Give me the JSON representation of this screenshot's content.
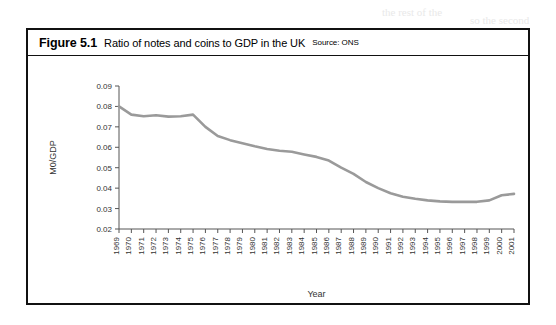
{
  "figure": {
    "number": "Figure 5.1",
    "caption": "Ratio of notes and coins to GDP in the UK",
    "source": "Source: ONS"
  },
  "page_bleed": [
    {
      "text": "the rest of the",
      "x": 382,
      "y": 6
    },
    {
      "text": "so the second",
      "x": 470,
      "y": 14
    },
    {
      "text": "to see that a measurement in the currency",
      "x": 60,
      "y": 60
    },
    {
      "text": "in a period of depreciation",
      "x": 150,
      "y": 78
    },
    {
      "text": "of the money supply",
      "x": 300,
      "y": 90
    },
    {
      "text": "including the ratio of",
      "x": 120,
      "y": 140
    },
    {
      "text": "a number of the",
      "x": 250,
      "y": 150
    },
    {
      "text": "the velocity of",
      "x": 90,
      "y": 172
    },
    {
      "text": "is clear that the",
      "x": 230,
      "y": 182
    },
    {
      "text": "and so the",
      "x": 330,
      "y": 196
    },
    {
      "text": "a falling trend",
      "x": 110,
      "y": 205
    }
  ],
  "chart_data": {
    "type": "line",
    "title": "Ratio of notes and coins to GDP in the UK",
    "xlabel": "Year",
    "ylabel": "M0/GDP",
    "xlim": [
      1969,
      2001
    ],
    "ylim": [
      0.02,
      0.09
    ],
    "yticks": [
      0.02,
      0.03,
      0.04,
      0.05,
      0.06,
      0.07,
      0.08,
      0.09
    ],
    "ytick_labels": [
      "0.02",
      "0.03",
      "0.04",
      "0.05",
      "0.06",
      "0.07",
      "0.08",
      "0.09"
    ],
    "grid": false,
    "legend": "none",
    "series": [
      {
        "name": "M0/GDP",
        "color": "#9a9a9a",
        "x": [
          1969,
          1970,
          1971,
          1972,
          1973,
          1974,
          1975,
          1976,
          1977,
          1978,
          1979,
          1980,
          1981,
          1982,
          1983,
          1984,
          1985,
          1986,
          1987,
          1988,
          1989,
          1990,
          1991,
          1992,
          1993,
          1994,
          1995,
          1996,
          1997,
          1998,
          1999,
          2000,
          2001
        ],
        "values": [
          0.08,
          0.076,
          0.0752,
          0.0757,
          0.075,
          0.0752,
          0.076,
          0.07,
          0.0655,
          0.0635,
          0.062,
          0.0605,
          0.0592,
          0.0583,
          0.0578,
          0.0565,
          0.0553,
          0.0535,
          0.05,
          0.047,
          0.043,
          0.04,
          0.0375,
          0.0358,
          0.0348,
          0.034,
          0.0335,
          0.0333,
          0.0333,
          0.0333,
          0.034,
          0.0365,
          0.0372
        ]
      }
    ],
    "xtick_labels": [
      "1969",
      "1970",
      "1971",
      "1972",
      "1973",
      "1974",
      "1975",
      "1976",
      "1977",
      "1978",
      "1979",
      "1980",
      "1981",
      "1982",
      "1983",
      "1984",
      "1985",
      "1986",
      "1987",
      "1988",
      "1989",
      "1990",
      "1991",
      "1992",
      "1993",
      "1994",
      "1995",
      "1996",
      "1997",
      "1998",
      "1999",
      "2000",
      "2001"
    ]
  }
}
